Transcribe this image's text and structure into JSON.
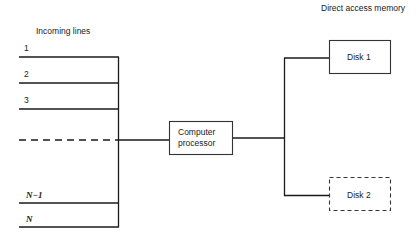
{
  "title_left": "Incoming lines",
  "title_right": "Direct access memory",
  "incoming_lines": [
    {
      "label": "1",
      "style": "solid"
    },
    {
      "label": "2",
      "style": "solid"
    },
    {
      "label": "3",
      "style": "solid"
    },
    {
      "label": "",
      "style": "dashed"
    },
    {
      "label": "N−1",
      "style": "solid",
      "italic": true
    },
    {
      "label": "N",
      "style": "solid",
      "italic": true
    }
  ],
  "processor": {
    "line1": "Computer",
    "line2": "processor"
  },
  "disks": [
    {
      "label": "Disk 1",
      "style": "solid"
    },
    {
      "label": "Disk 2",
      "style": "dashed"
    }
  ]
}
